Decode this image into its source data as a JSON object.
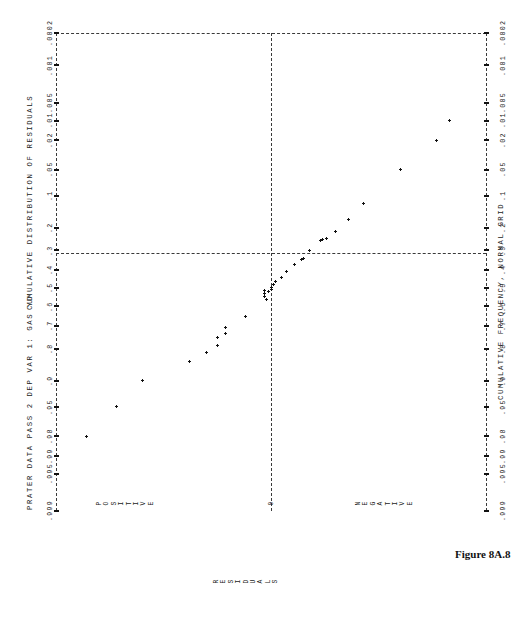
{
  "figure": {
    "caption": "Figure 8A.8"
  },
  "plot": {
    "header_left": "PRATER DATA PASS 2  DEP VAR 1: GAS YD",
    "header_top_axis_title": "CUMULATIVE DISTRIBUTION OF RESIDUALS",
    "bottom_axis_title": "CUMULATIVE FREQUENCY, NORMAL GRID",
    "residual_axis_label": "RESIDUALS",
    "direction_labels": {
      "positive": "POSITIVE",
      "zero": "0",
      "negative": "NEGATIVE"
    }
  },
  "chart_data": {
    "type": "scatter",
    "title": "CUMULATIVE DISTRIBUTION OF RESIDUALS",
    "subtitle": "PRATER DATA PASS 2  DEP VAR 1: GAS YD",
    "xlabel": "CUMULATIVE FREQUENCY, NORMAL GRID",
    "ylabel": "RESIDUALS",
    "orientation": "rotated-90",
    "grid": true,
    "legend": null,
    "probability_ticks": [
      ".0002",
      ".001",
      ".005",
      ".01",
      ".02",
      ".05",
      ".1",
      ".2",
      ".3",
      ".4",
      ".5",
      ".6",
      ".7",
      ".8",
      ".9",
      ".95",
      ".98",
      ".99",
      ".995",
      ".999"
    ],
    "probability_values": [
      0.0002,
      0.001,
      0.005,
      0.01,
      0.02,
      0.05,
      0.1,
      0.2,
      0.3,
      0.4,
      0.5,
      0.6,
      0.7,
      0.8,
      0.9,
      0.95,
      0.98,
      0.99,
      0.995,
      0.999
    ],
    "residual_axis_zero_label": "0",
    "residual_axis_positive_label": "POSITIVE",
    "residual_axis_negative_label": "NEGATIVE",
    "reference_lines": [
      {
        "name": "median-line",
        "at_probability": 0.5,
        "style": "dashed"
      },
      {
        "name": "zero-residual-line",
        "at_residual": 0,
        "style": "dashed"
      },
      {
        "name": "left-frame",
        "at_probability": 0.0002,
        "style": "dashed"
      },
      {
        "name": "top-frame",
        "style": "dashed"
      }
    ],
    "points": [
      {
        "p": 0.98,
        "residual": 0.86
      },
      {
        "p": 0.95,
        "residual": 0.72
      },
      {
        "p": 0.9,
        "residual": 0.6
      },
      {
        "p": 0.845,
        "residual": 0.38
      },
      {
        "p": 0.815,
        "residual": 0.3
      },
      {
        "p": 0.785,
        "residual": 0.25
      },
      {
        "p": 0.755,
        "residual": 0.25
      },
      {
        "p": 0.735,
        "residual": 0.21
      },
      {
        "p": 0.705,
        "residual": 0.21
      },
      {
        "p": 0.655,
        "residual": 0.12
      },
      {
        "p": 0.545,
        "residual": 0.03
      },
      {
        "p": 0.53,
        "residual": 0.03
      },
      {
        "p": 0.515,
        "residual": 0.03
      },
      {
        "p": 0.56,
        "residual": 0.02
      },
      {
        "p": 0.52,
        "residual": 0.01
      },
      {
        "p": 0.505,
        "residual": 0.0
      },
      {
        "p": 0.495,
        "residual": 0.0
      },
      {
        "p": 0.48,
        "residual": -0.01
      },
      {
        "p": 0.465,
        "residual": -0.02
      },
      {
        "p": 0.44,
        "residual": -0.05
      },
      {
        "p": 0.41,
        "residual": -0.07
      },
      {
        "p": 0.37,
        "residual": -0.11
      },
      {
        "p": 0.345,
        "residual": -0.14
      },
      {
        "p": 0.34,
        "residual": -0.15
      },
      {
        "p": 0.3,
        "residual": -0.18
      },
      {
        "p": 0.255,
        "residual": -0.23
      },
      {
        "p": 0.25,
        "residual": -0.24
      },
      {
        "p": 0.245,
        "residual": -0.26
      },
      {
        "p": 0.215,
        "residual": -0.3
      },
      {
        "p": 0.17,
        "residual": -0.36
      },
      {
        "p": 0.12,
        "residual": -0.43
      },
      {
        "p": 0.05,
        "residual": -0.6
      },
      {
        "p": 0.02,
        "residual": -0.77
      },
      {
        "p": 0.01,
        "residual": -0.83
      }
    ]
  }
}
